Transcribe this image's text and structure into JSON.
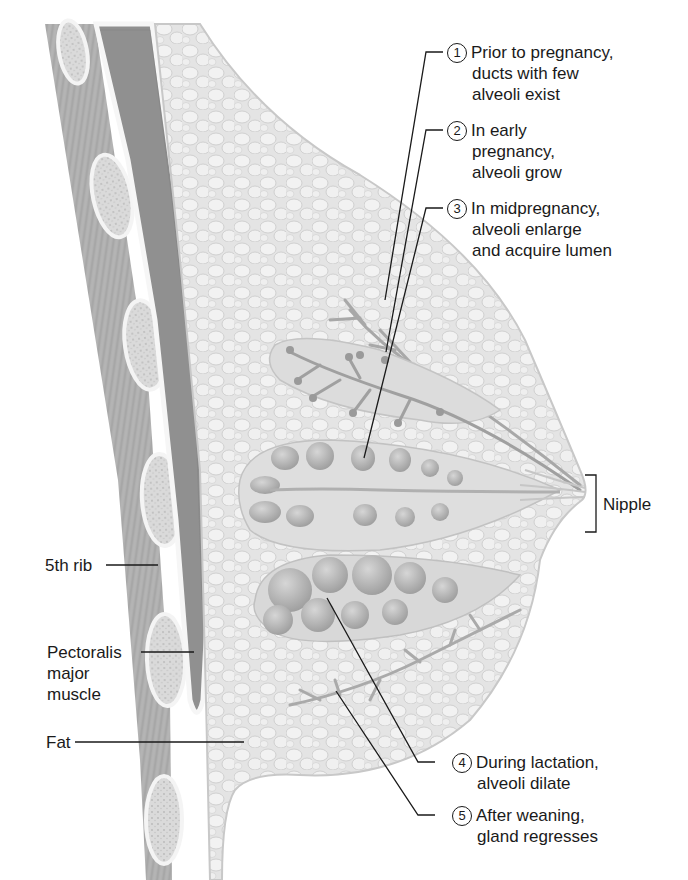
{
  "diagram": {
    "colors": {
      "background": "#ffffff",
      "muscle": "#9a9a9a",
      "rib": "#d8d8d8",
      "fat": "#e6e6e6",
      "gland": "#b5b5b5",
      "leader_line": "#1a1a1a",
      "text": "#1a1a1a"
    },
    "left_labels": [
      {
        "id": "rib",
        "text": "5th rib"
      },
      {
        "id": "pectoralis",
        "lines": [
          "Pectoralis",
          "major",
          "muscle"
        ]
      },
      {
        "id": "fat",
        "text": "Fat"
      }
    ],
    "right_label": {
      "id": "nipple",
      "text": "Nipple"
    },
    "callouts": [
      {
        "number": "1",
        "lines": [
          "Prior to pregnancy,",
          "ducts with few",
          "alveoli exist"
        ]
      },
      {
        "number": "2",
        "lines": [
          "In early",
          "pregnancy,",
          "alveoli grow"
        ]
      },
      {
        "number": "3",
        "lines": [
          "In midpregnancy,",
          "alveoli enlarge",
          "and acquire lumen"
        ]
      },
      {
        "number": "4",
        "lines": [
          "During lactation,",
          "alveoli dilate"
        ]
      },
      {
        "number": "5",
        "lines": [
          "After weaning,",
          "gland regresses"
        ]
      }
    ]
  }
}
